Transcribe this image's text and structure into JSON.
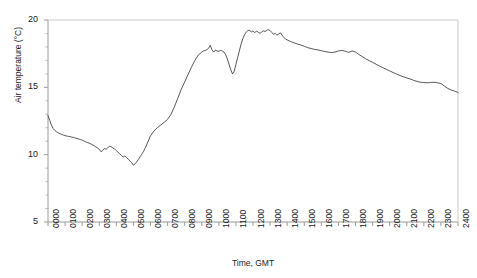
{
  "chart_data": {
    "type": "line",
    "title": "",
    "xlabel": "Time, GMT",
    "ylabel": "Air temperature (°C)",
    "ylim": [
      5,
      20
    ],
    "yticks": [
      5,
      10,
      15,
      20
    ],
    "ytick_labels": [
      "5",
      "10",
      "15",
      "20"
    ],
    "xlim": [
      0,
      24
    ],
    "xticks": [
      0,
      1,
      2,
      3,
      4,
      5,
      6,
      7,
      8,
      9,
      10,
      11,
      12,
      13,
      14,
      15,
      16,
      17,
      18,
      19,
      20,
      21,
      22,
      23,
      24
    ],
    "xtick_labels": [
      "0000",
      "0100",
      "0200",
      "0300",
      "0400",
      "0500",
      "0600",
      "0700",
      "0800",
      "0900",
      "1000",
      "1100",
      "1200",
      "1300",
      "1400",
      "1500",
      "1600",
      "1700",
      "1800",
      "1900",
      "2000",
      "2100",
      "2200",
      "2300",
      "2400"
    ],
    "grid": false,
    "legend": "none",
    "line_color": "#444444",
    "series": [
      {
        "name": "Air temperature",
        "x": [
          0.0,
          0.1,
          0.2,
          0.3,
          0.4,
          0.5,
          0.6,
          0.7,
          0.8,
          0.9,
          1.0,
          1.1,
          1.2,
          1.3,
          1.4,
          1.5,
          1.6,
          1.7,
          1.8,
          1.9,
          2.0,
          2.1,
          2.2,
          2.3,
          2.4,
          2.5,
          2.6,
          2.7,
          2.8,
          2.9,
          3.0,
          3.1,
          3.2,
          3.3,
          3.4,
          3.5,
          3.6,
          3.7,
          3.8,
          3.9,
          4.0,
          4.1,
          4.2,
          4.3,
          4.4,
          4.5,
          4.6,
          4.7,
          4.8,
          4.9,
          5.0,
          5.1,
          5.2,
          5.3,
          5.4,
          5.5,
          5.6,
          5.7,
          5.8,
          5.9,
          6.0,
          6.2,
          6.4,
          6.6,
          6.8,
          7.0,
          7.2,
          7.4,
          7.6,
          7.8,
          8.0,
          8.2,
          8.4,
          8.6,
          8.8,
          9.0,
          9.1,
          9.2,
          9.3,
          9.4,
          9.5,
          9.6,
          9.7,
          9.8,
          9.9,
          10.0,
          10.1,
          10.2,
          10.3,
          10.4,
          10.5,
          10.6,
          10.7,
          10.8,
          10.9,
          11.0,
          11.1,
          11.2,
          11.3,
          11.4,
          11.5,
          11.6,
          11.7,
          11.8,
          11.9,
          12.0,
          12.1,
          12.2,
          12.3,
          12.4,
          12.5,
          12.6,
          12.7,
          12.8,
          12.9,
          13.0,
          13.1,
          13.2,
          13.3,
          13.4,
          13.5,
          13.6,
          13.7,
          13.8,
          13.9,
          14.0,
          14.2,
          14.4,
          14.6,
          14.8,
          15.0,
          15.2,
          15.4,
          15.6,
          15.8,
          16.0,
          16.2,
          16.4,
          16.6,
          16.8,
          17.0,
          17.2,
          17.4,
          17.6,
          17.8,
          18.0,
          18.2,
          18.4,
          18.6,
          18.8,
          19.0,
          19.2,
          19.4,
          19.6,
          19.8,
          20.0,
          20.2,
          20.4,
          20.6,
          20.8,
          21.0,
          21.2,
          21.4,
          21.6,
          21.8,
          22.0,
          22.2,
          22.4,
          22.6,
          22.8,
          23.0,
          23.2,
          23.4,
          23.6,
          23.8,
          24.0
        ],
        "y": [
          12.9,
          12.55,
          12.2,
          11.95,
          11.8,
          11.7,
          11.62,
          11.55,
          11.5,
          11.46,
          11.42,
          11.38,
          11.36,
          11.34,
          11.3,
          11.28,
          11.24,
          11.2,
          11.16,
          11.12,
          11.08,
          11.02,
          10.96,
          10.9,
          10.86,
          10.8,
          10.74,
          10.66,
          10.58,
          10.5,
          10.4,
          10.22,
          10.3,
          10.46,
          10.4,
          10.52,
          10.62,
          10.58,
          10.5,
          10.42,
          10.3,
          10.18,
          10.06,
          9.95,
          9.82,
          9.9,
          9.78,
          9.66,
          9.54,
          9.4,
          9.22,
          9.32,
          9.48,
          9.66,
          9.86,
          10.06,
          10.26,
          10.52,
          10.8,
          11.1,
          11.4,
          11.75,
          12.0,
          12.2,
          12.4,
          12.62,
          13.0,
          13.55,
          14.2,
          14.85,
          15.4,
          15.95,
          16.5,
          17.0,
          17.4,
          17.62,
          17.7,
          17.74,
          17.8,
          17.9,
          18.12,
          17.78,
          17.62,
          17.76,
          17.7,
          17.68,
          17.74,
          17.7,
          17.62,
          17.42,
          17.1,
          16.7,
          16.3,
          16.0,
          16.2,
          16.7,
          17.2,
          17.7,
          18.2,
          18.6,
          18.9,
          19.1,
          19.22,
          19.25,
          19.1,
          19.2,
          19.05,
          19.18,
          19.1,
          19.02,
          19.1,
          19.2,
          19.15,
          19.22,
          19.28,
          19.22,
          19.08,
          18.94,
          19.0,
          18.88,
          18.95,
          19.05,
          18.88,
          18.7,
          18.6,
          18.52,
          18.4,
          18.3,
          18.22,
          18.14,
          18.05,
          17.95,
          17.88,
          17.82,
          17.78,
          17.72,
          17.66,
          17.62,
          17.58,
          17.62,
          17.7,
          17.74,
          17.68,
          17.6,
          17.7,
          17.62,
          17.44,
          17.28,
          17.12,
          16.98,
          16.86,
          16.72,
          16.58,
          16.46,
          16.34,
          16.22,
          16.1,
          15.98,
          15.88,
          15.78,
          15.7,
          15.62,
          15.52,
          15.44,
          15.38,
          15.36,
          15.34,
          15.36,
          15.38,
          15.34,
          15.28,
          15.1,
          14.92,
          14.8,
          14.72,
          14.62
        ]
      }
    ]
  },
  "axis": {
    "ylabel_text": "Air temperature (°C)",
    "xlabel_text": "Time, GMT"
  }
}
